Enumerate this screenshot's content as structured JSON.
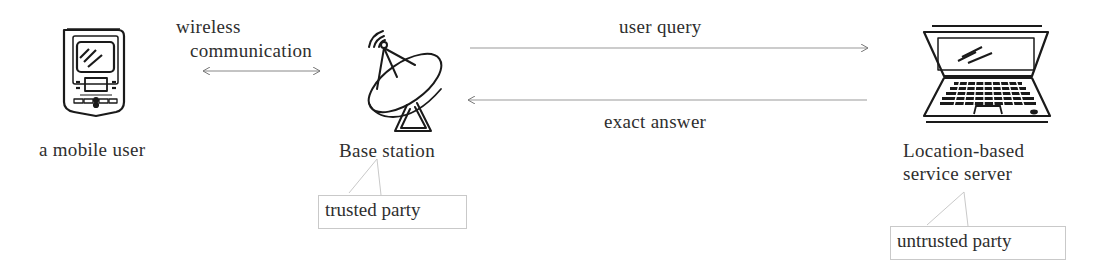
{
  "nodes": {
    "mobile_user": {
      "label": "a mobile user",
      "icon": "pda-icon"
    },
    "base_station": {
      "label": "Base station",
      "icon": "satellite-dish-icon",
      "callout": "trusted party"
    },
    "lbs_server": {
      "label_line1": "Location-based",
      "label_line2": "service server",
      "icon": "laptop-icon",
      "callout": "untrusted party"
    }
  },
  "edges": {
    "wireless": {
      "label_line1": "wireless",
      "label_line2": "communication",
      "direction": "bidirectional"
    },
    "user_query": {
      "label": "user query",
      "direction": "base_station-to-server"
    },
    "exact_answer": {
      "label": "exact answer",
      "direction": "server-to-base_station"
    }
  },
  "colors": {
    "stroke": "#1a1a1a",
    "arrow": "#888888",
    "callout_border": "#c9c9c9",
    "text": "#2e2e2e"
  }
}
